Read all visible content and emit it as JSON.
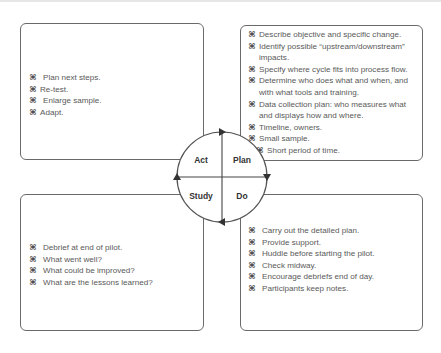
{
  "diagram": {
    "cycle": {
      "quadrants": [
        {
          "id": "act",
          "label": "Act"
        },
        {
          "id": "plan",
          "label": "Plan"
        },
        {
          "id": "study",
          "label": "Study"
        },
        {
          "id": "do",
          "label": "Do"
        }
      ]
    },
    "boxes": {
      "act": {
        "items": [
          {
            "text": "Plan next steps.",
            "style": "gap"
          },
          {
            "text": "Re-test.",
            "style": "normal"
          },
          {
            "text": "Enlarge sample.",
            "style": "gap"
          },
          {
            "text": "Adapt.",
            "style": "normal"
          }
        ]
      },
      "plan": {
        "items": [
          {
            "text": "Describe objective and specific change.",
            "style": "normal"
          },
          {
            "text": "Identify possible “upstream/downstream”",
            "style": "normal"
          },
          {
            "text": "impacts.",
            "style": "cont"
          },
          {
            "text": "Specify where cycle fits into process flow.",
            "style": "normal"
          },
          {
            "text": "Determine who does what and when, and",
            "style": "normal"
          },
          {
            "text": "with what tools and training.",
            "style": "cont"
          },
          {
            "text": "Data collection plan: who measures what",
            "style": "normal"
          },
          {
            "text": "and displays how and where.",
            "style": "cont"
          },
          {
            "text": "Timeline, owners.",
            "style": "normal"
          },
          {
            "text": "Small sample.",
            "style": "normal"
          },
          {
            "text": "Short period of time.",
            "style": "sub"
          }
        ]
      },
      "study": {
        "items": [
          {
            "text": "Debrief at end of pilot.",
            "style": "normal"
          },
          {
            "text": "What went well?",
            "style": "normal"
          },
          {
            "text": "What could be improved?",
            "style": "normal"
          },
          {
            "text": "What are the lessons learned?",
            "style": "normal"
          }
        ]
      },
      "do": {
        "items": [
          {
            "text": "Carry out the detailed plan.",
            "style": "normal"
          },
          {
            "text": "Provide support.",
            "style": "normal"
          },
          {
            "text": "Huddle before starting the pilot.",
            "style": "normal"
          },
          {
            "text": "Check midway.",
            "style": "normal"
          },
          {
            "text": "Encourage debriefs end of day.",
            "style": "normal"
          },
          {
            "text": "Participants keep notes.",
            "style": "normal"
          }
        ]
      }
    },
    "bullet_glyph": "⌘",
    "colors": {
      "border": "#6a6a6a",
      "text": "#595959",
      "label": "#333333",
      "arrow": "#333333"
    }
  }
}
